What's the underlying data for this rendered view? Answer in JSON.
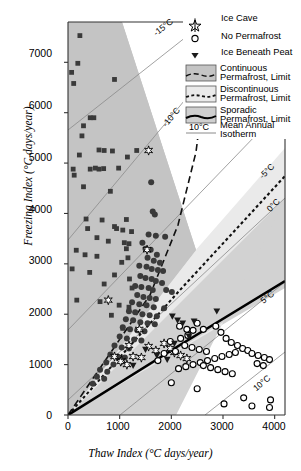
{
  "chart_data": {
    "type": "scatter",
    "title": "",
    "xlabel": "Thaw Index (°C days/year)",
    "ylabel": "Freezing Index (°C days/year)",
    "xlim": [
      0,
      4200
    ],
    "ylim": [
      0,
      7800
    ],
    "xticks": [
      0,
      1000,
      2000,
      3000,
      4000
    ],
    "yticks": [
      0,
      1000,
      2000,
      3000,
      4000,
      5000,
      6000,
      7000
    ],
    "grid": false,
    "legend_position": "top-right",
    "series": [
      {
        "name": "Continuous Permafrost",
        "marker": "square",
        "fill": "#3a3a3a",
        "points": [
          [
            230,
            7530
          ],
          [
            70,
            6800
          ],
          [
            110,
            6580
          ],
          [
            190,
            6980
          ],
          [
            900,
            6660
          ],
          [
            430,
            5900
          ],
          [
            500,
            5900
          ],
          [
            300,
            5740
          ],
          [
            270,
            5540
          ],
          [
            220,
            5160
          ],
          [
            600,
            5260
          ],
          [
            700,
            5250
          ],
          [
            860,
            5240
          ],
          [
            1330,
            5250
          ],
          [
            1150,
            5120
          ],
          [
            100,
            4880
          ],
          [
            120,
            4760
          ],
          [
            430,
            4880
          ],
          [
            530,
            4900
          ],
          [
            600,
            4880
          ],
          [
            690,
            4890
          ],
          [
            980,
            4900
          ],
          [
            300,
            4530
          ],
          [
            820,
            4440
          ],
          [
            1130,
            3880
          ],
          [
            350,
            3890
          ],
          [
            660,
            3870
          ],
          [
            900,
            3740
          ],
          [
            940,
            3700
          ],
          [
            1060,
            3670
          ],
          [
            380,
            3700
          ],
          [
            1230,
            3640
          ],
          [
            560,
            3520
          ],
          [
            780,
            3450
          ],
          [
            1090,
            3420
          ],
          [
            1180,
            3400
          ],
          [
            1130,
            3300
          ],
          [
            160,
            3270
          ],
          [
            330,
            3180
          ],
          [
            560,
            3150
          ],
          [
            1160,
            3120
          ],
          [
            1040,
            3030
          ],
          [
            80,
            2900
          ],
          [
            420,
            2830
          ],
          [
            900,
            2780
          ],
          [
            1190,
            2700
          ],
          [
            700,
            2600
          ],
          [
            1240,
            2520
          ],
          [
            170,
            2280
          ],
          [
            620,
            2250
          ],
          [
            990,
            2180
          ],
          [
            1180,
            2140
          ],
          [
            840,
            1980
          ],
          [
            1060,
            1720
          ]
        ]
      },
      {
        "name": "Discontinuous Permafrost",
        "marker": "circle-filled",
        "fill": "#3a3a3a",
        "points": [
          [
            1610,
            4620
          ],
          [
            1640,
            4040
          ],
          [
            1680,
            3980
          ],
          [
            1560,
            3580
          ],
          [
            1700,
            3560
          ],
          [
            1880,
            3540
          ],
          [
            1440,
            3420
          ],
          [
            1500,
            3300
          ],
          [
            1600,
            3280
          ],
          [
            1720,
            3180
          ],
          [
            1540,
            3120
          ],
          [
            1660,
            3060
          ],
          [
            1780,
            3020
          ],
          [
            1380,
            2960
          ],
          [
            1520,
            2940
          ],
          [
            1620,
            2900
          ],
          [
            1740,
            2880
          ],
          [
            1840,
            2860
          ],
          [
            1400,
            2760
          ],
          [
            1500,
            2720
          ],
          [
            1620,
            2700
          ],
          [
            1700,
            2660
          ],
          [
            1820,
            2620
          ],
          [
            1300,
            2560
          ],
          [
            1420,
            2540
          ],
          [
            1560,
            2520
          ],
          [
            1640,
            2480
          ],
          [
            1900,
            2480
          ],
          [
            2010,
            2440
          ],
          [
            1340,
            2380
          ],
          [
            1460,
            2340
          ],
          [
            1580,
            2320
          ],
          [
            1700,
            2300
          ],
          [
            1240,
            2240
          ],
          [
            1380,
            2200
          ],
          [
            1520,
            2180
          ],
          [
            1660,
            2140
          ],
          [
            1860,
            2120
          ],
          [
            1180,
            2060
          ],
          [
            1300,
            2040
          ],
          [
            1440,
            2000
          ],
          [
            1580,
            1980
          ],
          [
            1720,
            1960
          ],
          [
            1120,
            1900
          ],
          [
            1260,
            1880
          ],
          [
            1400,
            1840
          ],
          [
            1540,
            1820
          ],
          [
            1680,
            1800
          ],
          [
            1060,
            1740
          ],
          [
            1200,
            1700
          ],
          [
            1340,
            1680
          ],
          [
            1480,
            1660
          ],
          [
            1000,
            1560
          ],
          [
            1140,
            1520
          ],
          [
            1280,
            1500
          ],
          [
            1420,
            1480
          ],
          [
            900,
            1380
          ],
          [
            1040,
            1340
          ],
          [
            1180,
            1320
          ],
          [
            820,
            1200
          ],
          [
            960,
            1160
          ],
          [
            1100,
            1140
          ],
          [
            740,
            1040
          ],
          [
            880,
            1000
          ],
          [
            620,
            900
          ],
          [
            760,
            860
          ],
          [
            560,
            760
          ],
          [
            700,
            720
          ],
          [
            480,
            620
          ]
        ]
      },
      {
        "name": "Ice Cave",
        "marker": "star",
        "fill": "#ffffff",
        "points": [
          [
            1560,
            5250
          ],
          [
            1530,
            3280
          ],
          [
            1380,
            1700
          ],
          [
            1180,
            1380
          ],
          [
            1560,
            1360
          ],
          [
            1700,
            1280
          ],
          [
            1260,
            1160
          ],
          [
            1420,
            1140
          ],
          [
            1860,
            1420
          ],
          [
            1980,
            1320
          ],
          [
            2060,
            1240
          ],
          [
            1040,
            1080
          ],
          [
            1140,
            1000
          ],
          [
            2180,
            1180
          ],
          [
            2300,
            1120
          ],
          [
            780,
            2280
          ],
          [
            900,
            1160
          ],
          [
            1020,
            1060
          ]
        ]
      },
      {
        "name": "No Permafrost",
        "marker": "circle-open",
        "fill": "#ffffff",
        "points": [
          [
            2500,
            1820
          ],
          [
            2420,
            1680
          ],
          [
            2320,
            1580
          ],
          [
            2180,
            1520
          ],
          [
            2620,
            1700
          ],
          [
            2260,
            1380
          ],
          [
            2400,
            1340
          ],
          [
            2540,
            1300
          ],
          [
            2680,
            1260
          ],
          [
            2080,
            1260
          ],
          [
            2860,
            1760
          ],
          [
            2960,
            1640
          ],
          [
            3060,
            1520
          ],
          [
            3160,
            1440
          ],
          [
            3280,
            1380
          ],
          [
            3380,
            1320
          ],
          [
            3480,
            1280
          ],
          [
            3240,
            1240
          ],
          [
            3120,
            1200
          ],
          [
            2980,
            1160
          ],
          [
            2840,
            1120
          ],
          [
            2700,
            1080
          ],
          [
            2560,
            1040
          ],
          [
            2420,
            1000
          ],
          [
            2280,
            960
          ],
          [
            2140,
            920
          ],
          [
            3560,
            1220
          ],
          [
            3680,
            1180
          ],
          [
            3800,
            1140
          ],
          [
            3900,
            1100
          ],
          [
            3660,
            1020
          ],
          [
            3780,
            980
          ],
          [
            2000,
            640
          ],
          [
            2500,
            520
          ],
          [
            3400,
            340
          ],
          [
            3920,
            300
          ],
          [
            3020,
            220
          ],
          [
            3560,
            180
          ],
          [
            3900,
            150
          ],
          [
            2160,
            1760
          ],
          [
            2300,
            1700
          ],
          [
            1980,
            1460
          ],
          [
            1860,
            1220
          ],
          [
            1740,
            1080
          ],
          [
            2620,
            980
          ],
          [
            2760,
            940
          ],
          [
            2900,
            900
          ],
          [
            3040,
            860
          ],
          [
            3180,
            820
          ]
        ]
      },
      {
        "name": "Ice Beneath Peat",
        "marker": "triangle-down",
        "fill": "#1a1a1a",
        "points": [
          [
            2020,
            1960
          ],
          [
            2120,
            1880
          ],
          [
            2220,
            1820
          ],
          [
            2440,
            1860
          ],
          [
            2880,
            2060
          ],
          [
            2340,
            1560
          ],
          [
            1500,
            1300
          ],
          [
            1720,
            1180
          ],
          [
            1260,
            980
          ],
          [
            2060,
            1420
          ],
          [
            1920,
            1100
          ]
        ]
      }
    ],
    "zones": [
      {
        "name": "Continuous Permafrost, Limit",
        "fill": "#c3c3c3",
        "line": "dashed"
      },
      {
        "name": "Discontinuous Permafrost, Limit",
        "fill": "#e6e6e6",
        "line": "dotted-dashed"
      },
      {
        "name": "Sporadic Permafrost, Limit",
        "fill": "#cfcfcf",
        "line": "solid-thick"
      }
    ],
    "isotherms": [
      {
        "label": "-15°C"
      },
      {
        "label": "-10°C"
      },
      {
        "label": "-5°C"
      },
      {
        "label": "0°C"
      },
      {
        "label": "5°C"
      },
      {
        "label": "10°C"
      }
    ]
  },
  "axes": {
    "ylabel": "Freezing Index (°C days/year)",
    "xlabel": "Thaw Index (°C days/year)",
    "yticks": [
      "0",
      "1000",
      "2000",
      "3000",
      "4000",
      "5000",
      "6000",
      "7000"
    ],
    "xticks": [
      "0",
      "1000",
      "2000",
      "3000",
      "4000"
    ]
  },
  "legend": {
    "items": [
      {
        "label": "Ice Cave",
        "marker": "star-icon"
      },
      {
        "label": "No Permafrost",
        "marker": "circle-open-icon"
      },
      {
        "label": "Ice Beneath Peat",
        "marker": "triangle-down-icon"
      }
    ],
    "zones": [
      {
        "line1": "Continuous",
        "line2": "Permafrost,  Limit",
        "swatch": "#c3c3c3"
      },
      {
        "line1": "Discontinuous",
        "line2": "Permafrost,  Limit",
        "swatch": "#e6e6e6"
      },
      {
        "line1": "Sporadic",
        "line2": "Permafrost,  Limit",
        "swatch": "#cfcfcf"
      }
    ],
    "isotherm": {
      "key": "10°C",
      "line1": "Mean Annual",
      "line2": "Isotherm"
    }
  },
  "isotherm_labels": {
    "m15": "-15°C",
    "m10": "-10°C",
    "m5": "-5°C",
    "z0": "0°C",
    "p5": "5°C",
    "p10": "10°C"
  }
}
